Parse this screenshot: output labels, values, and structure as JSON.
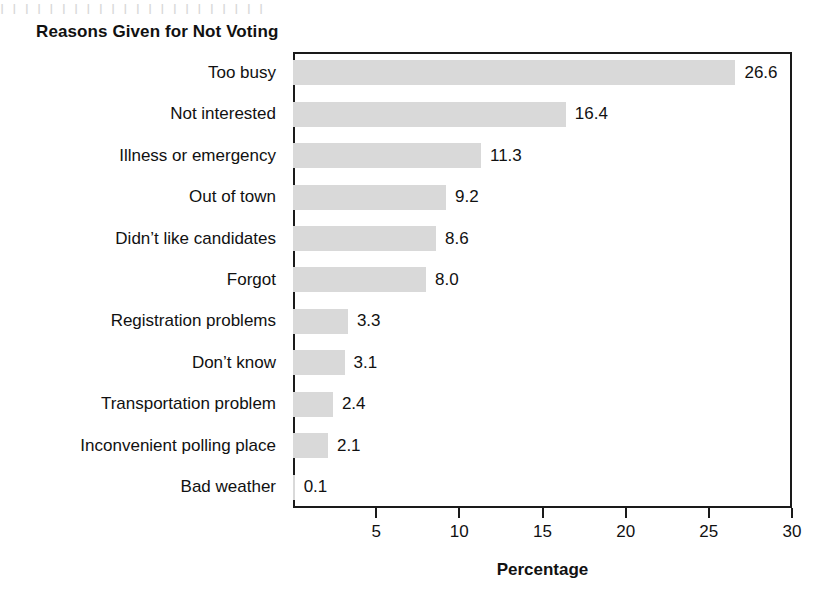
{
  "page": {
    "bleed_text": "I I  I I   I   I  I    I    I  I I    I    I  I   I    I   I   I   I I   I  I"
  },
  "chart_data": {
    "type": "bar",
    "orientation": "horizontal",
    "title": "Reasons Given for Not Voting",
    "xlabel": "Percentage",
    "ylabel": "",
    "categories": [
      "Too busy",
      "Not interested",
      "Illness or emergency",
      "Out of town",
      "Didn’t like candidates",
      "Forgot",
      "Registration problems",
      "Don’t know",
      "Transportation problem",
      "Inconvenient polling place",
      "Bad weather"
    ],
    "values": [
      26.6,
      16.4,
      11.3,
      9.2,
      8.6,
      8.0,
      3.3,
      3.1,
      2.4,
      2.1,
      0.1
    ],
    "value_labels": [
      "26.6",
      "16.4",
      "11.3",
      "9.2",
      "8.6",
      "8.0",
      "3.3",
      "3.1",
      "2.4",
      "2.1",
      "0.1"
    ],
    "xlim": [
      0,
      30
    ],
    "xticks": [
      5,
      10,
      15,
      20,
      25,
      30
    ],
    "xtick_labels": [
      "5",
      "10",
      "15",
      "20",
      "25",
      "30"
    ],
    "grid": false,
    "legend": false,
    "bar_color": "#d9d9d9",
    "axis_color": "#1a1a1a",
    "text_color": "#111111"
  }
}
